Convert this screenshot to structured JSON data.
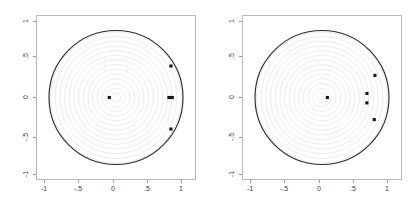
{
  "figure": {
    "background_color": "#ffffff",
    "width": 411,
    "height": 207,
    "panel_count": 2
  },
  "chart_data": [
    {
      "type": "scatter",
      "panel": "left",
      "title": "",
      "subtitle": "",
      "xlabel": "",
      "ylabel": "",
      "xlim": [
        -1.08,
        1.08
      ],
      "ylim": [
        -1.08,
        1.08
      ],
      "xticks": [
        -1,
        -0.5,
        0,
        0.5,
        1
      ],
      "xticklabels": [
        "-1",
        "-.5",
        "0",
        ".5",
        "1"
      ],
      "yticks": [
        -1,
        -0.5,
        0,
        0.5,
        1
      ],
      "yticklabels": [
        "-1",
        "-.5",
        "0",
        ".5",
        "1"
      ],
      "grid": "concentric-circles",
      "grid_circle_radii": [
        0.07,
        0.14,
        0.21,
        0.28,
        0.35,
        0.42,
        0.49,
        0.56,
        0.63,
        0.7,
        0.77,
        0.84,
        0.91,
        0.98
      ],
      "grid_color": "#e2e2e2",
      "unit_circle": {
        "radius": 1.0,
        "color": "#2b2b2b",
        "linewidth": 1.15
      },
      "legend": null,
      "point_color": "#161616",
      "points": [
        {
          "x": -0.1,
          "y": 0.0
        },
        {
          "x": 0.82,
          "y": 0.47
        },
        {
          "x": 0.79,
          "y": 0.0
        },
        {
          "x": 0.84,
          "y": 0.0
        },
        {
          "x": 0.81,
          "y": 0.0
        },
        {
          "x": 0.82,
          "y": -0.47
        }
      ]
    },
    {
      "type": "scatter",
      "panel": "right",
      "title": "",
      "subtitle": "",
      "xlabel": "",
      "ylabel": "",
      "xlim": [
        -1.08,
        1.08
      ],
      "ylim": [
        -1.08,
        1.08
      ],
      "xticks": [
        -1,
        -0.5,
        0,
        0.5,
        1
      ],
      "xticklabels": [
        "-1",
        "-.5",
        "0",
        ".5",
        "1"
      ],
      "yticks": [
        -1,
        -0.5,
        0,
        0.5,
        1
      ],
      "yticklabels": [
        "-1",
        "-.5",
        "0",
        ".5",
        "1"
      ],
      "grid": "concentric-circles",
      "grid_circle_radii": [
        0.07,
        0.14,
        0.21,
        0.28,
        0.35,
        0.42,
        0.49,
        0.56,
        0.63,
        0.7,
        0.77,
        0.84,
        0.91,
        0.98
      ],
      "grid_color": "#e2e2e2",
      "unit_circle": {
        "radius": 1.0,
        "color": "#2b2b2b",
        "linewidth": 1.15
      },
      "legend": null,
      "point_color": "#161616",
      "points": [
        {
          "x": 0.08,
          "y": 0.0
        },
        {
          "x": 0.79,
          "y": 0.33
        },
        {
          "x": 0.67,
          "y": 0.06
        },
        {
          "x": 0.67,
          "y": -0.08
        },
        {
          "x": 0.78,
          "y": -0.33
        }
      ]
    }
  ]
}
